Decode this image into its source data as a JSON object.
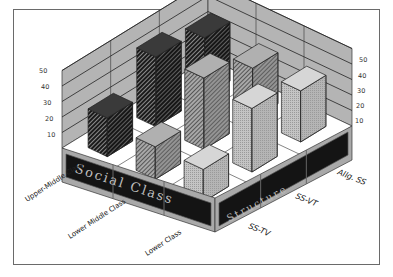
{
  "chart_data": {
    "type": "bar",
    "subtype": "3d-grouped-bar",
    "title": "",
    "categories": [
      "Upper-Middle Class",
      "Lower Middle Class",
      "Lower Class"
    ],
    "category_axis_title": "Social Class",
    "series": [
      {
        "name": "SS-TV",
        "values": [
          33,
          41,
          21
        ],
        "pattern": "light-gray-dots",
        "color": "#b8b8b8"
      },
      {
        "name": "SS-VT",
        "values": [
          33,
          46,
          21
        ],
        "pattern": "medium-gray-hatch",
        "color": "#8c8c8c"
      },
      {
        "name": "Allg. SS",
        "values": [
          38,
          45,
          25
        ],
        "pattern": "dark-hatch",
        "color": "#2a2a2a"
      }
    ],
    "series_axis_title": "Structure",
    "yticks": [
      10,
      20,
      30,
      40,
      50
    ],
    "ylim": [
      0,
      50
    ],
    "grid": true,
    "legend": "none",
    "xlabel": "",
    "ylabel": ""
  },
  "axis": {
    "left_ticks": [
      "10",
      "20",
      "30",
      "40",
      "50"
    ],
    "right_ticks": [
      "10",
      "20",
      "30",
      "40",
      "50"
    ]
  },
  "labels": {
    "cat0": "Upper-Middle Class",
    "cat1": "Lower Middle Class",
    "cat2": "Lower Class",
    "ser0": "SS-TV",
    "ser1": "SS-VT",
    "ser2": "Allg. SS",
    "band_left": "Social Class",
    "band_right": "Structure"
  }
}
